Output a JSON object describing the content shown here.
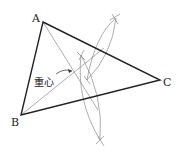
{
  "figure": {
    "vertices": {
      "A": {
        "label": "A"
      },
      "B": {
        "label": "B"
      },
      "C": {
        "label": "C"
      }
    },
    "centroid_label": "重心",
    "colors": {
      "triangle": "#222222",
      "construction": "#8a8a8a"
    }
  }
}
